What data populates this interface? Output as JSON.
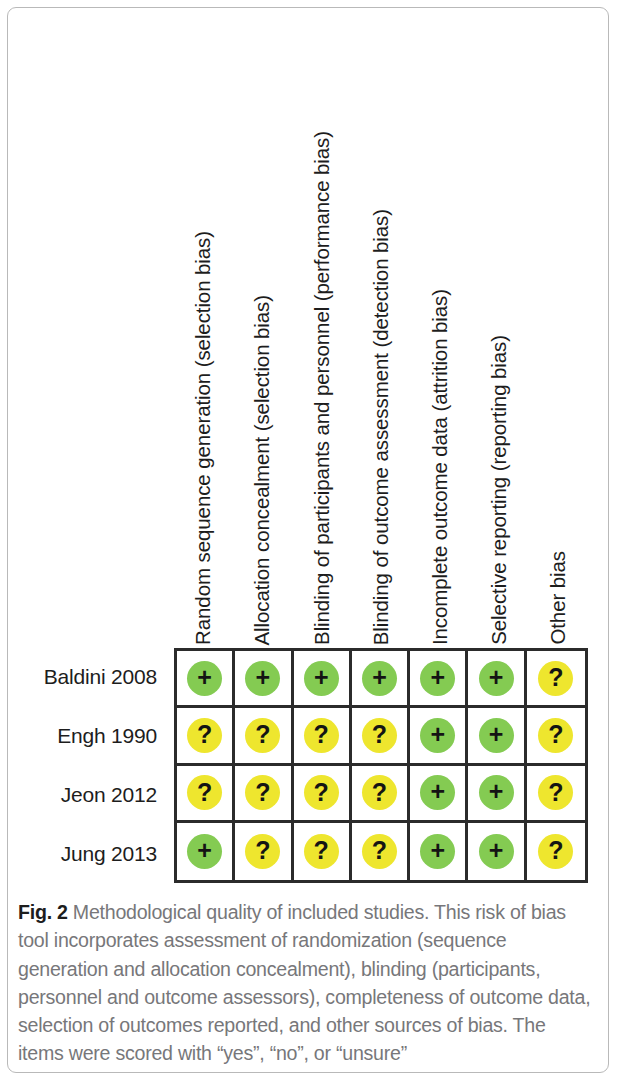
{
  "figure": {
    "caption_label": "Fig. 2",
    "caption_text": " Methodological quality of included studies. This risk of bias tool incorporates assessment of randomization (sequence generation and allocation concealment), blinding (participants, personnel and outcome assessors), completeness of outcome data, selection of outcomes reported, and other sources of bias. The items were scored with “yes”, “no”, or “unsure”"
  },
  "colors": {
    "low_risk": "#84cb52",
    "unclear_risk": "#eee62e",
    "grid_line": "#2b2b2b",
    "text": "#1d1d1d",
    "caption_text": "#77777a"
  },
  "symbols": {
    "low_risk": "+",
    "unclear_risk": "?"
  },
  "chart_data": {
    "type": "table",
    "title": "Methodological quality of included studies",
    "categories": [
      "Random sequence generation (selection bias)",
      "Allocation concealment (selection bias)",
      "Blinding of participants and personnel (performance bias)",
      "Blinding of outcome assessment (detection bias)",
      "Incomplete outcome data (attrition bias)",
      "Selective reporting (reporting bias)",
      "Other bias"
    ],
    "rows": [
      {
        "study": "Baldini 2008",
        "judgements": [
          "low",
          "low",
          "low",
          "low",
          "low",
          "low",
          "unclear"
        ]
      },
      {
        "study": "Engh 1990",
        "judgements": [
          "unclear",
          "unclear",
          "unclear",
          "unclear",
          "low",
          "low",
          "unclear"
        ]
      },
      {
        "study": "Jeon 2012",
        "judgements": [
          "unclear",
          "unclear",
          "unclear",
          "unclear",
          "low",
          "low",
          "unclear"
        ]
      },
      {
        "study": "Jung 2013",
        "judgements": [
          "low",
          "unclear",
          "unclear",
          "unclear",
          "low",
          "low",
          "unclear"
        ]
      }
    ],
    "legend": {
      "low": "Low risk of bias (+)",
      "unclear": "Unclear risk of bias (?)"
    },
    "xlabel": "",
    "ylabel": "",
    "grid": true
  }
}
